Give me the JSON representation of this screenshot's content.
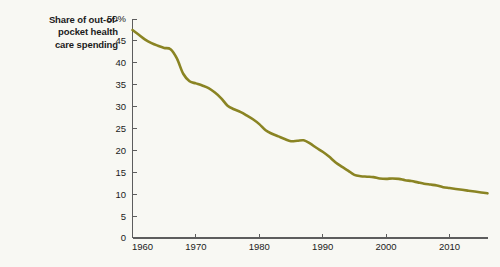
{
  "figure": {
    "background_color": "#f8f8f3",
    "title_lines": [
      "Share of out-of-",
      "pocket health",
      "care spending"
    ],
    "title_full": "Share of out-of-pocket health care spending"
  },
  "chart_data": {
    "type": "line",
    "xlabel": "",
    "ylabel": "",
    "xlim": [
      1960,
      2016
    ],
    "ylim": [
      0,
      50
    ],
    "grid": false,
    "legend": null,
    "line_color": "#8a8423",
    "line_width": 2.6,
    "y_ticks": [
      0,
      5,
      10,
      15,
      20,
      25,
      30,
      35,
      40,
      45,
      50
    ],
    "y_tick_labels": [
      "0",
      "5",
      "10",
      "15",
      "20",
      "25",
      "30",
      "35",
      "40",
      "45",
      "50%"
    ],
    "x_ticks": [
      1960,
      1970,
      1980,
      1990,
      2000,
      2010
    ],
    "x_tick_labels": [
      "1960",
      "1970",
      "1980",
      "1990",
      "2000",
      "2010"
    ],
    "series": [
      {
        "name": "Share of out-of-pocket health care spending",
        "color": "#8a8423",
        "x": [
          1960,
          1961,
          1962,
          1963,
          1964,
          1965,
          1966,
          1967,
          1968,
          1969,
          1970,
          1971,
          1972,
          1973,
          1974,
          1975,
          1976,
          1977,
          1978,
          1979,
          1980,
          1981,
          1982,
          1983,
          1984,
          1985,
          1986,
          1987,
          1988,
          1989,
          1990,
          1991,
          1992,
          1993,
          1994,
          1995,
          1996,
          1997,
          1998,
          1999,
          2000,
          2001,
          2002,
          2003,
          2004,
          2005,
          2006,
          2007,
          2008,
          2009,
          2010,
          2011,
          2012,
          2013,
          2014,
          2015,
          2016
        ],
        "values": [
          47.5,
          46.4,
          45.3,
          44.5,
          43.9,
          43.4,
          43.1,
          41.0,
          37.5,
          35.8,
          35.3,
          34.8,
          34.2,
          33.2,
          31.9,
          30.2,
          29.4,
          28.8,
          28.0,
          27.1,
          26.0,
          24.6,
          23.8,
          23.2,
          22.6,
          22.1,
          22.2,
          22.3,
          21.6,
          20.6,
          19.7,
          18.6,
          17.3,
          16.3,
          15.4,
          14.4,
          14.1,
          14.0,
          13.9,
          13.6,
          13.5,
          13.6,
          13.5,
          13.2,
          13.0,
          12.7,
          12.4,
          12.2,
          12.0,
          11.6,
          11.4,
          11.2,
          11.0,
          10.8,
          10.6,
          10.4,
          10.2
        ]
      }
    ]
  }
}
